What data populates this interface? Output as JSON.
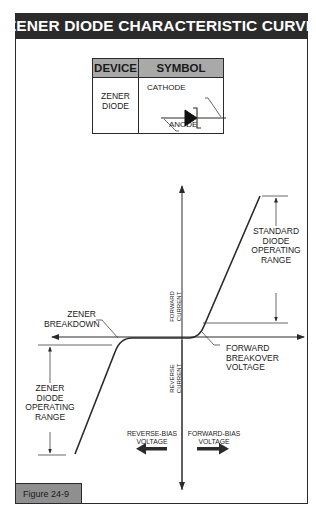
{
  "title": "ZENER DIODE CHARACTERISTIC CURVE",
  "symbol_table": {
    "headers": [
      "DEVICE",
      "SYMBOL"
    ],
    "rows": [
      {
        "device": [
          "ZENER",
          "DIODE"
        ],
        "symbol": {
          "icon": "zener-diode-symbol",
          "labels": {
            "cathode": "CATHODE",
            "anode": "ANODE"
          }
        }
      }
    ]
  },
  "axes": {
    "y_positive": [
      "FORWARD",
      "CURRENT"
    ],
    "y_negative": [
      "REVERSE",
      "CURRENT"
    ],
    "x_negative": [
      "REVERSE-BIAS",
      "VOLTAGE"
    ],
    "x_positive": [
      "FORWARD-BIAS",
      "VOLTAGE"
    ]
  },
  "annotations": {
    "zener_breakdown": [
      "ZENER",
      "BREAKDOWN"
    ],
    "zener_operating_range": [
      "ZENER",
      "DIODE",
      "OPERATING",
      "RANGE"
    ],
    "standard_operating_range": [
      "STANDARD",
      "DIODE",
      "OPERATING",
      "RANGE"
    ],
    "forward_breakover": [
      "FORWARD",
      "BREAKOVER",
      "VOLTAGE"
    ]
  },
  "figure_label": "Figure 24-9",
  "colors": {
    "title_bg": "#2b2b2b",
    "header_bg": "#a9a9a9",
    "figure_label_bg": "#8f8f8f",
    "line": "#2a2a2a"
  }
}
